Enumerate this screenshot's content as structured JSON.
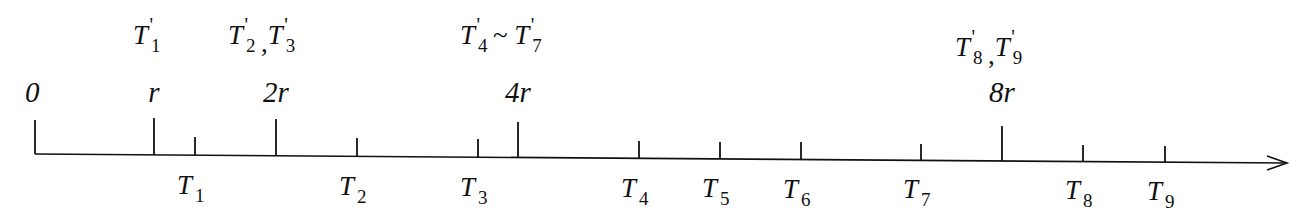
{
  "diagram": {
    "title": "",
    "axis": {
      "x_start": 35,
      "x_end": 1287,
      "y_start": 154,
      "y_end": 163,
      "arrow": true,
      "color": "#111111"
    },
    "major_marks": [
      {
        "label": "0",
        "x": 35,
        "top": 120
      },
      {
        "label": "r",
        "x": 154,
        "top": 118
      },
      {
        "label": "2r",
        "x": 276,
        "top": 119
      },
      {
        "label": "4r",
        "x": 518,
        "top": 122
      },
      {
        "label": "8r",
        "x": 1002,
        "top": 126
      }
    ],
    "minor_ticks": [
      {
        "name": "T",
        "sub": "1",
        "x": 195,
        "top": 137
      },
      {
        "name": "T",
        "sub": "2",
        "x": 357,
        "top": 138
      },
      {
        "name": "T",
        "sub": "3",
        "x": 478,
        "top": 139
      },
      {
        "name": "T",
        "sub": "4",
        "x": 639,
        "top": 141
      },
      {
        "name": "T",
        "sub": "5",
        "x": 720,
        "top": 142
      },
      {
        "name": "T",
        "sub": "6",
        "x": 801,
        "top": 142
      },
      {
        "name": "T",
        "sub": "7",
        "x": 921,
        "top": 144
      },
      {
        "name": "T",
        "sub": "8",
        "x": 1083,
        "top": 145
      },
      {
        "name": "T",
        "sub": "9",
        "x": 1165,
        "top": 146
      }
    ],
    "top_groups": [
      {
        "text": "T1'",
        "parts": [
          {
            "name": "T",
            "sub": "1"
          }
        ],
        "sep": "",
        "x": 133
      },
      {
        "text": "T2', T3'",
        "parts": [
          {
            "name": "T",
            "sub": "2"
          },
          {
            "name": "T",
            "sub": "3"
          }
        ],
        "sep": ",",
        "x": 228
      },
      {
        "text": "T4' ~ T7'",
        "parts": [
          {
            "name": "T",
            "sub": "4"
          },
          {
            "name": "T",
            "sub": "7"
          }
        ],
        "sep": "~",
        "x": 460
      },
      {
        "text": "T8', T9'",
        "parts": [
          {
            "name": "T",
            "sub": "8"
          },
          {
            "name": "T",
            "sub": "9"
          }
        ],
        "sep": ",",
        "x": 955
      }
    ],
    "prime_symbol": "'"
  }
}
